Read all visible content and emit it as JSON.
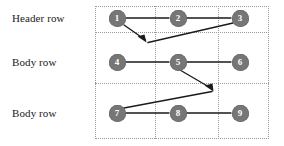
{
  "diagram": {
    "row_labels": [
      {
        "id": "header-row",
        "text": "Header row"
      },
      {
        "id": "body-row-1",
        "text": "Body row"
      },
      {
        "id": "body-row-2",
        "text": "Body row"
      }
    ],
    "nodes": [
      {
        "id": "n1",
        "label": "1",
        "x": 117,
        "y": 18
      },
      {
        "id": "n2",
        "label": "2",
        "x": 178,
        "y": 18
      },
      {
        "id": "n3",
        "label": "3",
        "x": 240,
        "y": 18
      },
      {
        "id": "n4",
        "label": "4",
        "x": 117,
        "y": 62
      },
      {
        "id": "n5",
        "label": "5",
        "x": 178,
        "y": 62
      },
      {
        "id": "n6",
        "label": "6",
        "x": 240,
        "y": 62
      },
      {
        "id": "n7",
        "label": "7",
        "x": 117,
        "y": 113
      },
      {
        "id": "n8",
        "label": "8",
        "x": 178,
        "y": 113
      },
      {
        "id": "n9",
        "label": "9",
        "x": 240,
        "y": 113
      }
    ],
    "edges": [
      {
        "id": "e1-2",
        "from": "1",
        "to": "2",
        "arrow": false
      },
      {
        "id": "e2-3",
        "from": "2",
        "to": "3",
        "arrow": false
      },
      {
        "id": "e3-4",
        "from": "3",
        "to": "4",
        "arrow": true
      },
      {
        "id": "e4-5",
        "from": "4",
        "to": "5",
        "arrow": false
      },
      {
        "id": "e5-6",
        "from": "5",
        "to": "6",
        "arrow": false
      },
      {
        "id": "e6-7",
        "from": "6",
        "to": "7",
        "arrow": true
      },
      {
        "id": "e7-8",
        "from": "7",
        "to": "8",
        "arrow": false
      },
      {
        "id": "e8-9",
        "from": "8",
        "to": "9",
        "arrow": false
      },
      {
        "id": "e1-down",
        "from": "1",
        "to": "wrap-arrow-1",
        "arrow": true
      },
      {
        "id": "e5-down",
        "from": "5",
        "to": "wrap-arrow-2",
        "arrow": true
      }
    ],
    "arrowheads": [
      {
        "id": "arrowhead-1",
        "x": 146,
        "y": 41
      },
      {
        "id": "arrowhead-2",
        "x": 213,
        "y": 90
      }
    ],
    "grid": {
      "box": {
        "left": 95,
        "top": 6,
        "width": 174,
        "height": 133
      },
      "h_dividers_y": [
        32,
        83
      ],
      "v_dividers_x": [
        155,
        218
      ],
      "border_style": "dotted"
    },
    "colors": {
      "node_fill": "#767676",
      "node_text": "#ffffff",
      "edge": "#1a1a1a",
      "grid": "#9a9a9a",
      "label_text": "#1a1a1a",
      "background": "#ffffff"
    }
  }
}
